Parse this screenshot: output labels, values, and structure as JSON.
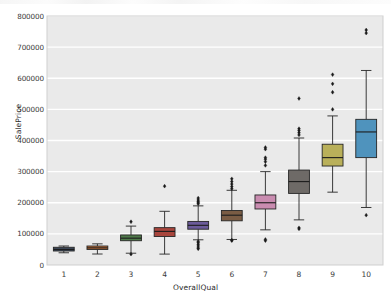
{
  "figure": {
    "background": "#ffffff",
    "plot_background": "#eaeaea",
    "gridline_color": "#ffffff",
    "spine_color": "#cfcfcf"
  },
  "chart_data": {
    "type": "box",
    "title": "",
    "xlabel": "OverallQual",
    "ylabel": "SalePrice",
    "categories": [
      "1",
      "2",
      "3",
      "4",
      "5",
      "6",
      "7",
      "8",
      "9",
      "10"
    ],
    "ylim": [
      0,
      800000
    ],
    "yticks": [
      0,
      100000,
      200000,
      300000,
      400000,
      500000,
      600000,
      700000,
      800000
    ],
    "ytick_labels": [
      "0",
      "100000",
      "200000",
      "300000",
      "400000",
      "500000",
      "600000",
      "700000",
      "800000"
    ],
    "grid": "horizontal",
    "legend": "none",
    "outlier_marker": "diamond",
    "outlier_color": "#1a1a1a",
    "boxes": [
      {
        "category": "1",
        "color": "#3d4a5c",
        "whisker_low": 39300,
        "q1": 45000,
        "median": 50000,
        "q3": 57000,
        "whisker_high": 61000,
        "outliers": []
      },
      {
        "category": "2",
        "color": "#c8733a",
        "whisker_low": 35311,
        "q1": 50000,
        "median": 55000,
        "q3": 61000,
        "whisker_high": 68000,
        "outliers": []
      },
      {
        "category": "3",
        "color": "#4f7a4a",
        "whisker_low": 37900,
        "q1": 78000,
        "median": 86250,
        "q3": 96500,
        "whisker_high": 125000,
        "outliers": [
          34900,
          139000
        ]
      },
      {
        "category": "4",
        "color": "#a8453c",
        "whisker_low": 35000,
        "q1": 91500,
        "median": 108000,
        "q3": 120000,
        "whisker_high": 172500,
        "outliers": [
          253293
        ]
      },
      {
        "category": "5",
        "color": "#6b5b9a",
        "whisker_low": 81000,
        "q1": 115000,
        "median": 127500,
        "q3": 140000,
        "whisker_high": 190000,
        "outliers": [
          52000,
          55000,
          61000,
          66500,
          72000,
          76000,
          196500,
          200000,
          204000,
          208900,
          215000
        ]
      },
      {
        "category": "6",
        "color": "#7a5c44",
        "whisker_low": 82000,
        "q1": 142000,
        "median": 160000,
        "q3": 175000,
        "whisker_high": 240000,
        "outliers": [
          78000,
          80000,
          245000,
          252000,
          260000,
          268000,
          277000
        ]
      },
      {
        "category": "7",
        "color": "#c98cb0",
        "whisker_low": 113000,
        "q1": 180000,
        "median": 200000,
        "q3": 225000,
        "whisker_high": 300000,
        "outliers": [
          78000,
          82000,
          320000,
          332000,
          340000,
          345000,
          372000,
          377500
        ]
      },
      {
        "category": "8",
        "color": "#6e6a67",
        "whisker_low": 145000,
        "q1": 230000,
        "median": 268000,
        "q3": 305000,
        "whisker_high": 408000,
        "outliers": [
          116050,
          119500,
          418000,
          425000,
          432000,
          438000,
          535000
        ]
      },
      {
        "category": "9",
        "color": "#b9b05a",
        "whisker_low": 234000,
        "q1": 318000,
        "median": 345000,
        "q3": 388000,
        "whisker_high": 479000,
        "outliers": [
          500000,
          555000,
          582000,
          611657
        ]
      },
      {
        "category": "10",
        "color": "#4f93bd",
        "whisker_low": 184750,
        "q1": 345000,
        "median": 427500,
        "q3": 468000,
        "whisker_high": 625000,
        "outliers": [
          160000,
          745000,
          755000
        ]
      }
    ]
  }
}
